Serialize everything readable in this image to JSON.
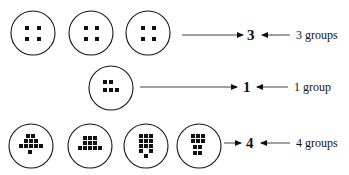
{
  "rows": [
    {
      "result": "3",
      "label": "3 groups",
      "circles": [
        {
          "cx": 33,
          "cy": 33,
          "dots": [
            [
              -7,
              -5
            ],
            [
              5,
              -5
            ],
            [
              -7,
              6
            ],
            [
              5,
              6
            ]
          ]
        },
        {
          "cx": 91,
          "cy": 33,
          "dots": [
            [
              -6,
              -5
            ],
            [
              5,
              -5
            ],
            [
              -6,
              6
            ],
            [
              5,
              6
            ]
          ]
        },
        {
          "cx": 148,
          "cy": 33,
          "dots": [
            [
              -6,
              -5
            ],
            [
              5,
              -5
            ],
            [
              -6,
              6
            ],
            [
              5,
              6
            ]
          ]
        }
      ],
      "arrow_to_result": {
        "x1": 182,
        "x2": 243,
        "y": 35
      },
      "arrow_from_label": {
        "x1": 290,
        "x2": 262,
        "y": 35
      }
    },
    {
      "result": "1",
      "label": "1 group",
      "circles": [
        {
          "cx": 111,
          "cy": 88,
          "dots": [
            [
              -7,
              -6
            ],
            [
              -1,
              -6
            ],
            [
              -7,
              2
            ],
            [
              -1,
              2
            ],
            [
              5,
              2
            ]
          ]
        }
      ],
      "arrow_to_result": {
        "x1": 140,
        "x2": 237,
        "y": 87
      },
      "arrow_from_label": {
        "x1": 288,
        "x2": 257,
        "y": 87
      }
    },
    {
      "result": "4",
      "label": "4 groups",
      "circles": [
        {
          "cx": 31,
          "cy": 146,
          "dots": [
            [
              -4,
              -10
            ],
            [
              1,
              -10
            ],
            [
              -6,
              -5
            ],
            [
              -1,
              -5
            ],
            [
              4,
              -5
            ],
            [
              -11,
              0
            ],
            [
              -6,
              0
            ],
            [
              -1,
              0
            ],
            [
              4,
              0
            ],
            [
              9,
              0
            ],
            [
              -2,
              6
            ]
          ]
        },
        {
          "cx": 90,
          "cy": 146,
          "dots": [
            [
              -6,
              -8
            ],
            [
              -1,
              -8
            ],
            [
              4,
              -8
            ],
            [
              -6,
              -3
            ],
            [
              -1,
              -3
            ],
            [
              4,
              -3
            ],
            [
              -11,
              2
            ],
            [
              -6,
              2
            ],
            [
              -1,
              2
            ],
            [
              4,
              2
            ],
            [
              9,
              2
            ]
          ]
        },
        {
          "cx": 146,
          "cy": 146,
          "dots": [
            [
              -6,
              -10
            ],
            [
              -1,
              -10
            ],
            [
              4,
              -10
            ],
            [
              -6,
              -5
            ],
            [
              -1,
              -5
            ],
            [
              4,
              -5
            ],
            [
              -6,
              0
            ],
            [
              -1,
              0
            ],
            [
              4,
              0
            ],
            [
              -6,
              5
            ],
            [
              4,
              5
            ],
            [
              -1,
              10
            ]
          ]
        },
        {
          "cx": 199,
          "cy": 146,
          "dots": [
            [
              -7,
              -10
            ],
            [
              -2,
              -10
            ],
            [
              3,
              -10
            ],
            [
              -7,
              -5
            ],
            [
              -2,
              -5
            ],
            [
              3,
              -5
            ],
            [
              -5,
              1
            ],
            [
              0,
              1
            ],
            [
              -5,
              7
            ],
            [
              0,
              7
            ]
          ]
        }
      ],
      "arrow_to_result": {
        "x1": 224,
        "x2": 241,
        "y": 143
      },
      "arrow_from_label": {
        "x1": 290,
        "x2": 261,
        "y": 143
      }
    }
  ],
  "circle_radius": 22,
  "dot_size": 4,
  "colors": {
    "ink": "#111111",
    "background": "#ffffff"
  }
}
